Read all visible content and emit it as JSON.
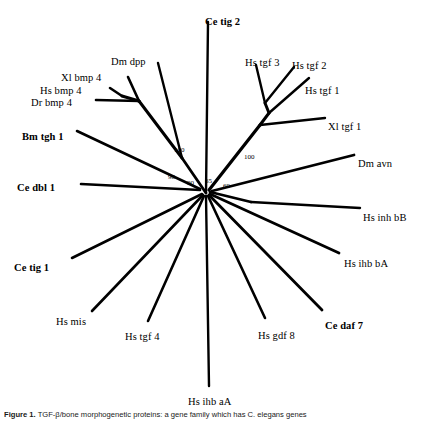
{
  "figure": {
    "caption_label": "Figure 1.",
    "caption_text": "TGF-β/bone morphogenetic proteins: a gene family which has C. elegans  genes"
  },
  "chart_data": {
    "type": "diagram",
    "subtype": "unrooted-phylogenetic-tree",
    "title": "",
    "taxa": [
      {
        "name": "Ce tig 2",
        "bold": true,
        "x": 205,
        "y": 16,
        "anchor": "start"
      },
      {
        "name": "Dm dpp",
        "bold": false,
        "x": 111,
        "y": 56,
        "anchor": "start"
      },
      {
        "name": "Xl bmp 4",
        "bold": false,
        "x": 61,
        "y": 72,
        "anchor": "start"
      },
      {
        "name": "Hs bmp 4",
        "bold": false,
        "x": 40,
        "y": 85,
        "anchor": "start"
      },
      {
        "name": "Dr bmp 4",
        "bold": false,
        "x": 31,
        "y": 97,
        "anchor": "start"
      },
      {
        "name": "Bm tgh 1",
        "bold": true,
        "x": 22,
        "y": 131,
        "anchor": "start"
      },
      {
        "name": "Ce dbl 1",
        "bold": true,
        "x": 17,
        "y": 182,
        "anchor": "start"
      },
      {
        "name": "Ce tig 1",
        "bold": true,
        "x": 14,
        "y": 262,
        "anchor": "start"
      },
      {
        "name": "Hs mis",
        "bold": false,
        "x": 56,
        "y": 316,
        "anchor": "start"
      },
      {
        "name": "Hs tgf 4",
        "bold": false,
        "x": 125,
        "y": 331,
        "anchor": "start"
      },
      {
        "name": "Hs ihb aA",
        "bold": false,
        "x": 188,
        "y": 396,
        "anchor": "start"
      },
      {
        "name": "Hs gdf 8",
        "bold": false,
        "x": 258,
        "y": 330,
        "anchor": "start"
      },
      {
        "name": "Ce daf 7",
        "bold": true,
        "x": 325,
        "y": 320,
        "anchor": "start"
      },
      {
        "name": "Hs ihb bA",
        "bold": false,
        "x": 344,
        "y": 258,
        "anchor": "start"
      },
      {
        "name": "Hs inh bB",
        "bold": false,
        "x": 363,
        "y": 212,
        "anchor": "start"
      },
      {
        "name": "Dm avn",
        "bold": false,
        "x": 358,
        "y": 158,
        "anchor": "start"
      },
      {
        "name": "Xl tgf 1",
        "bold": false,
        "x": 328,
        "y": 121,
        "anchor": "start"
      },
      {
        "name": "Hs tgf 1",
        "bold": false,
        "x": 305,
        "y": 85,
        "anchor": "start"
      },
      {
        "name": "Hs tgf 2",
        "bold": false,
        "x": 292,
        "y": 60,
        "anchor": "start"
      },
      {
        "name": "Hs tgf 3",
        "bold": false,
        "x": 245,
        "y": 57,
        "anchor": "start"
      }
    ],
    "support_values": [
      {
        "value": "100",
        "x": 174,
        "y": 146
      },
      {
        "value": "100",
        "x": 244,
        "y": 153
      },
      {
        "value": "98",
        "x": 168,
        "y": 173
      },
      {
        "value": "90",
        "x": 187,
        "y": 179
      },
      {
        "value": "65",
        "x": 205,
        "y": 177
      },
      {
        "value": "69",
        "x": 223,
        "y": 182
      }
    ],
    "branches": [
      {
        "id": "root-to-cetig2",
        "points": "206,193 208,22",
        "width": 2.4
      },
      {
        "id": "root-to-bmpnode",
        "points": "206,193 182,158",
        "width": 2.8
      },
      {
        "id": "bmpnode-to-dmdpp",
        "points": "182,158 158,63",
        "width": 2.4
      },
      {
        "id": "bmpnode-to-bmp",
        "points": "182,158 139,101",
        "width": 3.0
      },
      {
        "id": "bmpfork-stem",
        "points": "139,101 122,96",
        "width": 3.0
      },
      {
        "id": "bmp-to-xlbmp4",
        "points": "139,101 128,77",
        "width": 2.6
      },
      {
        "id": "bmp-to-hsbmp4",
        "points": "122,96 110,88",
        "width": 2.6
      },
      {
        "id": "bmp-to-drbmp4",
        "points": "139,101 96,100",
        "width": 2.6
      },
      {
        "id": "root-to-bmtgh1",
        "points": "200,189 77,131",
        "width": 2.6
      },
      {
        "id": "root-to-cedbl1",
        "points": "200,190 81,184",
        "width": 2.6
      },
      {
        "id": "root-to-cetig1",
        "points": "202,194 72,258",
        "width": 2.6
      },
      {
        "id": "root-to-hsmis",
        "points": "203,195 92,311",
        "width": 2.6
      },
      {
        "id": "root-to-hstgf4",
        "points": "204,196 148,321",
        "width": 2.6
      },
      {
        "id": "root-to-hsihbaA",
        "points": "206,196 209,386",
        "width": 2.4
      },
      {
        "id": "root-to-hsgdf8",
        "points": "208,196 265,318",
        "width": 2.6
      },
      {
        "id": "root-to-cedaf7",
        "points": "209,195 322,310",
        "width": 2.8
      },
      {
        "id": "root-to-hsihbbA",
        "points": "210,194 339,253",
        "width": 2.8
      },
      {
        "id": "root-to-inhnode",
        "points": "210,192 251,202",
        "width": 2.8
      },
      {
        "id": "inh-to-hsinhbB",
        "points": "251,202 360,208",
        "width": 2.4
      },
      {
        "id": "root-to-dmavn",
        "points": "212,191 354,155",
        "width": 2.8
      },
      {
        "id": "root-to-tgfnode",
        "points": "209,190 260,125",
        "width": 3.2
      },
      {
        "id": "tgf-to-xltgf1",
        "points": "260,125 325,118",
        "width": 2.4
      },
      {
        "id": "tgf-to-upper",
        "points": "260,125 269,113",
        "width": 3.0
      },
      {
        "id": "upper-to-hstgf1",
        "points": "269,113 309,78",
        "width": 2.4
      },
      {
        "id": "upper-to-tgf23",
        "points": "269,113 265,103",
        "width": 3.0
      },
      {
        "id": "tgf23-to-hstgf3",
        "points": "265,103 256,65",
        "width": 2.4
      },
      {
        "id": "tgf23-to-hstgf2",
        "points": "265,103 294,67",
        "width": 2.4
      }
    ],
    "style": {
      "line_color": "#000000",
      "background": "#ffffff"
    }
  }
}
